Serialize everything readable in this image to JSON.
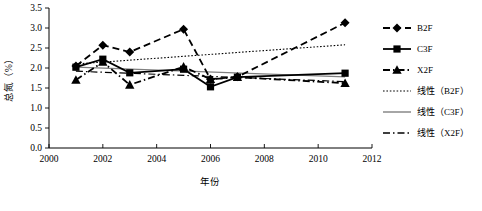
{
  "chart_data": {
    "type": "line",
    "title": "",
    "xlabel": "年份",
    "ylabel": "总氮（%）",
    "xlim": [
      2000,
      2012
    ],
    "ylim": [
      0.0,
      3.5
    ],
    "xticks": [
      "2000",
      "2002",
      "2004",
      "2006",
      "2008",
      "2010",
      "2012"
    ],
    "yticks": [
      "0.0",
      "0.5",
      "1.0",
      "1.5",
      "2.0",
      "2.5",
      "3.0",
      "3.5"
    ],
    "x": [
      2001,
      2002,
      2003,
      2005,
      2006,
      2007,
      2011
    ],
    "grid": false,
    "legend_position": "right",
    "series": [
      {
        "name": "B2F",
        "marker": "diamond",
        "linestyle": "dashed",
        "color": "#000000",
        "values": [
          2.05,
          2.57,
          2.4,
          2.97,
          1.72,
          1.78,
          3.13
        ]
      },
      {
        "name": "C3F",
        "marker": "square",
        "linestyle": "solid",
        "color": "#000000",
        "values": [
          2.02,
          2.22,
          1.88,
          1.97,
          1.53,
          1.77,
          1.87
        ]
      },
      {
        "name": "X2F",
        "marker": "triangle",
        "linestyle": "dashdot",
        "color": "#000000",
        "values": [
          1.7,
          2.15,
          1.58,
          2.03,
          1.72,
          1.77,
          1.62
        ]
      }
    ],
    "trendlines": [
      {
        "name": "线性（B2F）",
        "of": "B2F",
        "linestyle": "dotted",
        "color": "#000000",
        "x": [
          2001,
          2011
        ],
        "values": [
          2.1,
          2.58
        ]
      },
      {
        "name": "线性（C3F）",
        "of": "C3F",
        "linestyle": "solid",
        "color": "#808080",
        "x": [
          2001,
          2011
        ],
        "values": [
          2.02,
          1.78
        ]
      },
      {
        "name": "线性（X2F）",
        "of": "X2F",
        "linestyle": "dashdot",
        "color": "#000000",
        "x": [
          2001,
          2011
        ],
        "values": [
          1.92,
          1.66
        ]
      }
    ]
  },
  "legend": {
    "items": [
      {
        "label": "B2F",
        "marker": "diamond",
        "linestyle": "dashed",
        "color": "#000000"
      },
      {
        "label": "C3F",
        "marker": "square",
        "linestyle": "solid",
        "color": "#000000"
      },
      {
        "label": "X2F",
        "marker": "triangle",
        "linestyle": "dashdot",
        "color": "#000000"
      },
      {
        "label": "线性（B2F）",
        "marker": "none",
        "linestyle": "dotted",
        "color": "#000000"
      },
      {
        "label": "线性（C3F）",
        "marker": "none",
        "linestyle": "solid",
        "color": "#808080"
      },
      {
        "label": "线性（X2F）",
        "marker": "none",
        "linestyle": "dashdot",
        "color": "#000000"
      }
    ]
  },
  "axes": {
    "y_title": "总氮（%）",
    "x_title": "年份"
  }
}
